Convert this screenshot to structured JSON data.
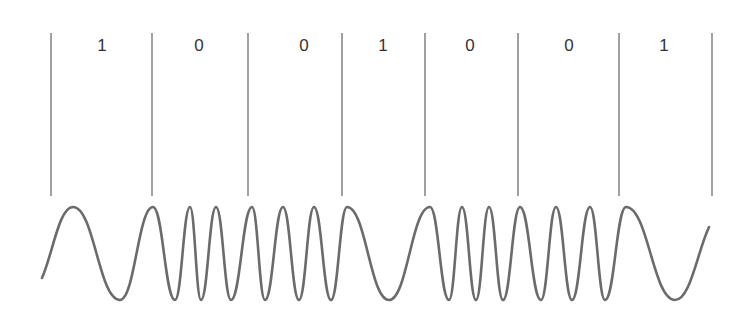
{
  "diagram": {
    "bits": [
      "1",
      "0",
      "0",
      "1",
      "0",
      "0",
      "1"
    ],
    "dividers_x": [
      51,
      152,
      248,
      342,
      425,
      518,
      619,
      712
    ],
    "divider_top": 33,
    "divider_bottom": 196,
    "label_y": 51,
    "label_x": [
      102,
      199,
      304,
      383,
      470,
      569,
      664
    ],
    "wave": {
      "color": "#6b6b6b",
      "peak_y": 207,
      "trough_y": 300,
      "start": [
        42,
        278
      ],
      "end": [
        709,
        227
      ],
      "peaks_x": [
        73,
        153,
        190,
        216,
        252,
        283,
        314,
        347,
        430,
        462,
        489,
        520,
        556,
        590,
        626
      ],
      "troughs_x": [
        120,
        175,
        201,
        231,
        265,
        299,
        331,
        389,
        449,
        476,
        503,
        541,
        572,
        605,
        675
      ],
      "description": "low frequency for bit 1, high frequency for bit 0"
    },
    "colors": {
      "line": "#6e6e6e",
      "text": "#333333",
      "background": "#ffffff"
    }
  }
}
